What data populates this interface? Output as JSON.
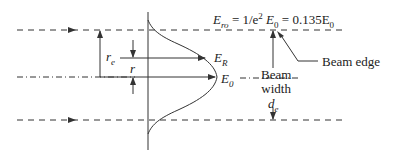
{
  "diagram": {
    "title_equation": {
      "lhs": "E",
      "lhs_sub": "ro",
      "middle": " = 1/e",
      "middle_sup": "2",
      "e0": " E",
      "e0_sub": "0",
      "rhs": " = 0.135E",
      "rhs_sub": "0"
    },
    "labels": {
      "r_e": "r",
      "r_e_sub": "e",
      "r": "r",
      "E_R": "E",
      "E_R_sub": "R",
      "E_0": "E",
      "E_0_sub": "0",
      "beam_width_line1": "Beam",
      "beam_width_line2": "width",
      "d_e": "d",
      "d_e_sub": "e",
      "beam_edge": "Beam edge"
    },
    "colors": {
      "line": "#333333",
      "text": "#222222"
    }
  }
}
